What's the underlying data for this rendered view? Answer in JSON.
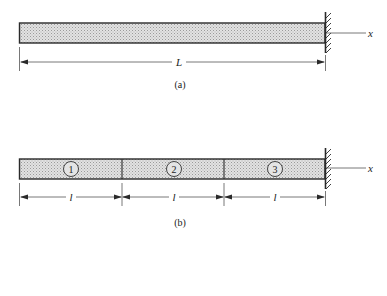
{
  "figure_a": {
    "caption": "(a)",
    "length_label": "L",
    "axis_label": "x"
  },
  "figure_b": {
    "caption": "(b)",
    "axis_label": "x",
    "elements": [
      {
        "number": "1",
        "length_label": "l"
      },
      {
        "number": "2",
        "length_label": "l"
      },
      {
        "number": "3",
        "length_label": "l"
      }
    ]
  },
  "colors": {
    "beam_fill": "#d4d4d4",
    "line": "#2a2a2a"
  }
}
